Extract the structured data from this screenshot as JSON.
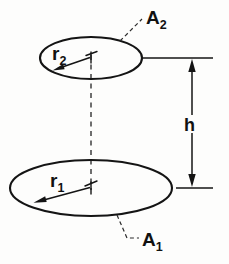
{
  "figure": {
    "background_color": "#fdfdfc",
    "line_color": "#141414"
  },
  "labels": {
    "upper_area": {
      "base": "A",
      "subscript": "2",
      "full": "A₂"
    },
    "lower_area": {
      "base": "A",
      "subscript": "1",
      "full": "A₁"
    },
    "upper_radius": {
      "base": "r",
      "subscript": "2",
      "full": "r₂"
    },
    "lower_radius": {
      "base": "r",
      "subscript": "1",
      "full": "r₁"
    },
    "separation": {
      "base": "h",
      "full": "h"
    }
  },
  "geometry": {
    "upper_disk": {
      "cx": 91,
      "cy": 58,
      "rx": 51,
      "ry": 21
    },
    "lower_disk": {
      "cx": 91,
      "cy": 188,
      "rx": 81,
      "ry": 28
    },
    "centerline": {
      "x": 91,
      "y_top": 55,
      "y_bottom": 190
    },
    "dimension_line": {
      "x": 192,
      "y_top": 58,
      "y_bottom": 188
    },
    "extension_top": {
      "y": 58,
      "x_start": 143,
      "x_end": 213
    },
    "extension_bottom": {
      "y": 188,
      "x_start": 176,
      "x_end": 213
    }
  }
}
